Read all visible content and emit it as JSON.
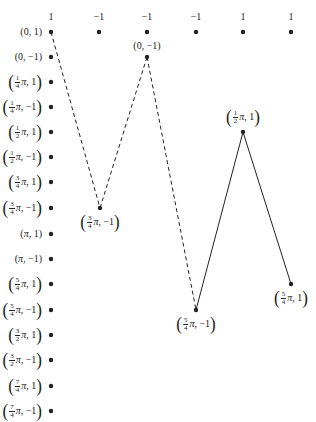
{
  "top_row": {
    "values": [
      "1",
      "−1",
      "−1",
      "−1",
      "1",
      "1"
    ],
    "x": [
      51,
      99,
      147,
      196,
      243,
      291
    ],
    "y": 32,
    "label_y": 14
  },
  "left_column": {
    "x": 51,
    "rows": [
      {
        "y": 32,
        "label": {
          "num": "",
          "den": "",
          "coef": "0",
          "second": "1"
        }
      },
      {
        "y": 57,
        "label": {
          "num": "",
          "den": "",
          "coef": "0",
          "second": "−1"
        }
      },
      {
        "y": 82,
        "label": {
          "num": "1",
          "den": "4",
          "coef": "π",
          "second": "1"
        }
      },
      {
        "y": 107,
        "label": {
          "num": "1",
          "den": "4",
          "coef": "π",
          "second": "−1"
        }
      },
      {
        "y": 132,
        "label": {
          "num": "1",
          "den": "2",
          "coef": "π",
          "second": "1"
        }
      },
      {
        "y": 157,
        "label": {
          "num": "1",
          "den": "2",
          "coef": "π",
          "second": "−1"
        }
      },
      {
        "y": 182,
        "label": {
          "num": "3",
          "den": "4",
          "coef": "π",
          "second": "1"
        }
      },
      {
        "y": 208,
        "label": {
          "num": "3",
          "den": "4",
          "coef": "π",
          "second": "−1"
        }
      },
      {
        "y": 234,
        "label": {
          "num": "",
          "den": "",
          "coef": "π",
          "second": "1"
        }
      },
      {
        "y": 259,
        "label": {
          "num": "",
          "den": "",
          "coef": "π",
          "second": "−1"
        }
      },
      {
        "y": 284,
        "label": {
          "num": "5",
          "den": "4",
          "coef": "π",
          "second": "1"
        }
      },
      {
        "y": 310,
        "label": {
          "num": "5",
          "den": "4",
          "coef": "π",
          "second": "−1"
        }
      },
      {
        "y": 335,
        "label": {
          "num": "3",
          "den": "2",
          "coef": "π",
          "second": "1"
        }
      },
      {
        "y": 360,
        "label": {
          "num": "3",
          "den": "2",
          "coef": "π",
          "second": "−1"
        }
      },
      {
        "y": 386,
        "label": {
          "num": "7",
          "den": "4",
          "coef": "π",
          "second": "1"
        }
      },
      {
        "y": 411,
        "label": {
          "num": "7",
          "den": "4",
          "coef": "π",
          "second": "−1"
        }
      }
    ]
  },
  "path": {
    "nodes": [
      {
        "x": 51,
        "y": 32,
        "label": null
      },
      {
        "x": 100,
        "y": 208,
        "label": {
          "num": "3",
          "den": "4",
          "coef": "π",
          "second": "−1"
        },
        "label_pos": "below"
      },
      {
        "x": 147,
        "y": 57,
        "label": {
          "num": "",
          "den": "",
          "coef": "0",
          "second": "−1"
        },
        "label_pos": "above"
      },
      {
        "x": 196,
        "y": 310,
        "label": {
          "num": "5",
          "den": "4",
          "coef": "π",
          "second": "−1"
        },
        "label_pos": "below"
      },
      {
        "x": 243,
        "y": 132,
        "label": {
          "num": "1",
          "den": "2",
          "coef": "π",
          "second": "1"
        },
        "label_pos": "above"
      },
      {
        "x": 291,
        "y": 284,
        "label": {
          "num": "5",
          "den": "4",
          "coef": "π",
          "second": "1"
        },
        "label_pos": "below"
      }
    ],
    "segments": [
      {
        "from": 0,
        "to": 1,
        "style": "dashed"
      },
      {
        "from": 1,
        "to": 2,
        "style": "dashed"
      },
      {
        "from": 2,
        "to": 3,
        "style": "dashed"
      },
      {
        "from": 3,
        "to": 4,
        "style": "solid"
      },
      {
        "from": 4,
        "to": 5,
        "style": "solid"
      }
    ]
  },
  "colors": {
    "ink": "#222222",
    "background": "#ffffff"
  }
}
